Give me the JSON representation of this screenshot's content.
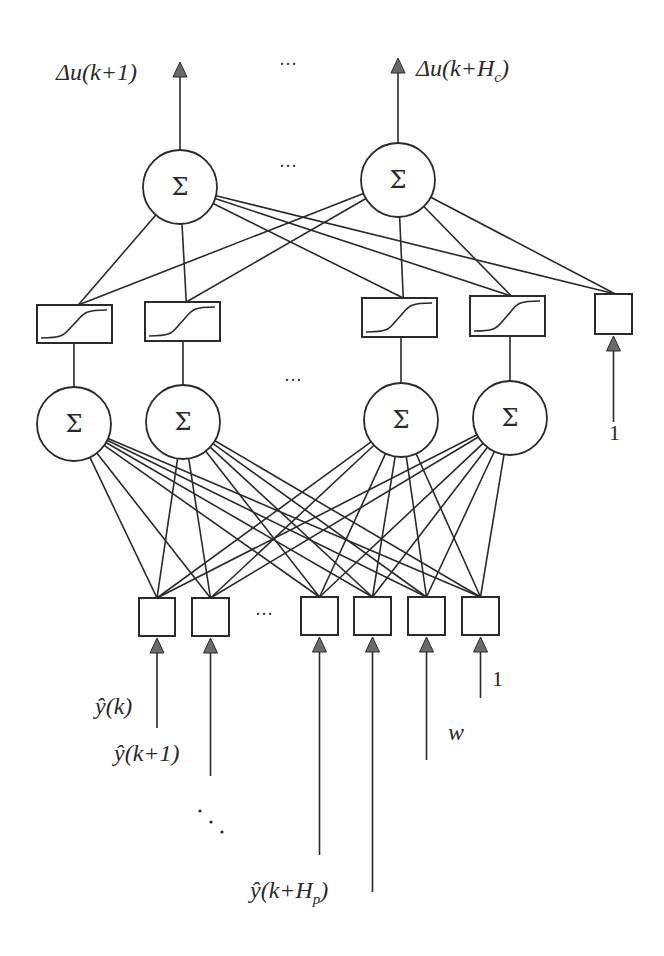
{
  "diagram": {
    "title": "",
    "type": "neural-network-predictive-controller",
    "colors": {
      "stroke": "#2a2a2a",
      "arrow_fill": "#6a6a6a",
      "background": "#ffffff"
    },
    "output_layer": {
      "node_symbol": "Σ",
      "nodes": [
        {
          "id": "out1",
          "cx": 180,
          "cy": 187,
          "r": 37,
          "label": "Δu(k+1)"
        },
        {
          "id": "out2",
          "cx": 398,
          "cy": 180,
          "r": 37,
          "label": "Δu(k+Hc)"
        }
      ],
      "ellipsis": "···"
    },
    "activation_layer": {
      "boxes": [
        {
          "id": "act1",
          "x": 37,
          "y": 305,
          "w": 75,
          "h": 38,
          "kind": "sigmoid"
        },
        {
          "id": "act2",
          "x": 145,
          "y": 302,
          "w": 75,
          "h": 39,
          "kind": "sigmoid"
        },
        {
          "id": "act3",
          "x": 362,
          "y": 298,
          "w": 75,
          "h": 39,
          "kind": "sigmoid"
        },
        {
          "id": "act4",
          "x": 470,
          "y": 296,
          "w": 75,
          "h": 40,
          "kind": "sigmoid"
        },
        {
          "id": "bias_hidden",
          "x": 595,
          "y": 294,
          "w": 37,
          "h": 40,
          "kind": "bias",
          "input_label": "1"
        }
      ]
    },
    "hidden_layer": {
      "node_symbol": "Σ",
      "nodes": [
        {
          "id": "h1",
          "cx": 74,
          "cy": 424,
          "r": 37
        },
        {
          "id": "h2",
          "cx": 183,
          "cy": 422,
          "r": 37
        },
        {
          "id": "h3",
          "cx": 401,
          "cy": 420,
          "r": 37
        },
        {
          "id": "h4",
          "cx": 510,
          "cy": 418,
          "r": 37
        }
      ],
      "ellipsis": "···"
    },
    "input_layer": {
      "boxes": [
        {
          "id": "in1",
          "x": 139,
          "y": 598,
          "w": 36,
          "h": 38,
          "label": "ŷ(k)"
        },
        {
          "id": "in2",
          "x": 192,
          "y": 598,
          "w": 37,
          "h": 38,
          "label": "ŷ(k+1)"
        },
        {
          "id": "in3",
          "x": 301,
          "y": 597,
          "w": 37,
          "h": 38,
          "label": "ŷ(k+Hp)"
        },
        {
          "id": "in4",
          "x": 354,
          "y": 597,
          "w": 37,
          "h": 38,
          "label": "ŷ(k+Hp)"
        },
        {
          "id": "in5",
          "x": 408,
          "y": 597,
          "w": 37,
          "h": 38,
          "label": "w"
        },
        {
          "id": "in6",
          "x": 462,
          "y": 597,
          "w": 37,
          "h": 38,
          "label": "1"
        }
      ],
      "ellipsis": "···",
      "vertical_ellipsis": "⋱"
    },
    "labels": {
      "out1": "Δu(k+1)",
      "out2_main": "Δu(k+H",
      "out2_sub": "c",
      "out2_close": ")",
      "top_ellipsis": "···",
      "mid_ellipsis": "···",
      "hidden_ellipsis": "···",
      "input_ellipsis": "···",
      "bias_hidden_input": "1",
      "bias_input": "1",
      "y_k": "ŷ(k)",
      "y_k1": "ŷ(k+1)",
      "y_hp_main": "ŷ(k+H",
      "y_hp_sub": "p",
      "y_hp_close": ")",
      "setpoint": "w",
      "diag_ellipsis": "⋱"
    }
  }
}
